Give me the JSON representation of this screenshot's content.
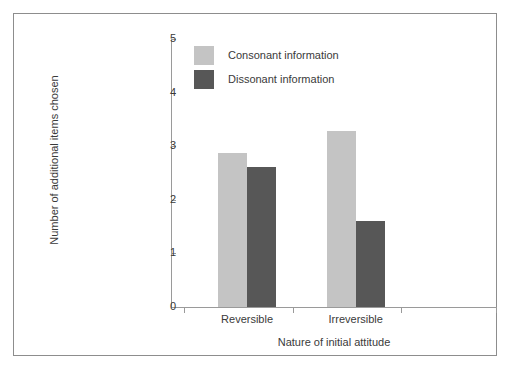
{
  "chart_data": {
    "type": "bar",
    "title": "",
    "subtitle": "",
    "xlabel": "Nature of initial attitude",
    "ylabel": "Number of additional items chosen",
    "categories": [
      "Reversible",
      "Irreversible"
    ],
    "series": [
      {
        "name": "Consonant information",
        "values": [
          2.87,
          3.28
        ],
        "color": "#c4c4c4"
      },
      {
        "name": "Dissonant information",
        "values": [
          2.62,
          1.61
        ],
        "color": "#575757"
      }
    ],
    "ylim": [
      0,
      5
    ],
    "yticks": [
      0,
      1,
      2,
      3,
      4,
      5
    ],
    "ytick_labels": [
      "0",
      "1",
      "2",
      "3",
      "4",
      "5"
    ],
    "grid": false,
    "legend_position": "top-center-inside",
    "axis_color": "#9a9a9a",
    "text_color": "#3a3a3a",
    "frame_color": "#8d8d8d",
    "background": "#ffffff"
  }
}
